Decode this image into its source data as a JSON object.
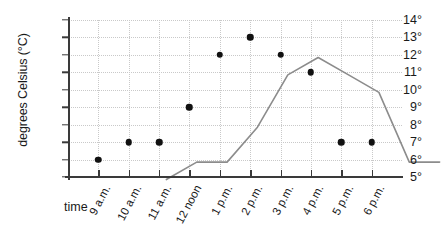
{
  "chart_data": {
    "type": "line",
    "title": "",
    "xlabel": "time",
    "ylabel": "degrees Celsius (°C)",
    "categories": [
      "9 a.m.",
      "10 a.m.",
      "11 a.m.",
      "12 noon",
      "1 p.m.",
      "2 p.m.",
      "3 p.m.",
      "4 p.m.",
      "5 p.m.",
      "6 p.m."
    ],
    "values": [
      6,
      7,
      7,
      9,
      12,
      13,
      12,
      11,
      7,
      7
    ],
    "ylim": [
      5,
      14
    ],
    "yticks": [
      5,
      6,
      7,
      8,
      9,
      10,
      11,
      12,
      13,
      14
    ],
    "ytick_labels": [
      "5°",
      "6°",
      "7°",
      "8°",
      "9°",
      "10°",
      "11°",
      "12°",
      "13°",
      "14°"
    ],
    "grid": true,
    "legend": false,
    "marker": "filled-circle",
    "line_color": "#8c8c8c",
    "marker_color": "#111111",
    "grid_color": "#c9c9c9",
    "axis_color": "#3a3a3a",
    "background": "#ffffff"
  },
  "axes": {
    "y_title": "degrees Celsius (°C)",
    "x_title": "time"
  }
}
